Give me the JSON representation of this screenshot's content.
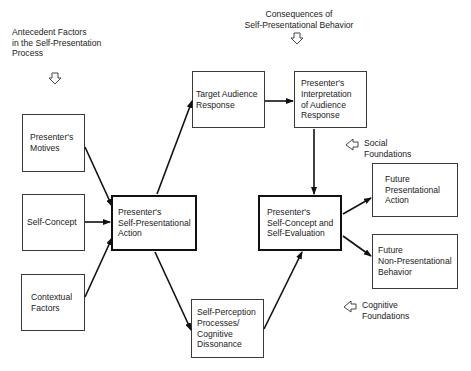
{
  "diagram": {
    "headers": {
      "antecedent": "Antecedent Factors\nin the Self-Presentation\nProcess",
      "consequences": "Consequences of\nSelf-Presentational Behavior"
    },
    "side_labels": {
      "social": "Social\nFoundations",
      "cognitive": "Cognitive\nFoundations"
    },
    "boxes": {
      "motives": "Presenter's\nMotives",
      "self_concept": "Self-Concept",
      "contextual": "Contextual\nFactors",
      "action": "Presenter's\nSelf-Presentational\nAction",
      "target_response": "Target Audience\nResponse",
      "interpretation": "Presenter's\nInterpretation\nof Audience\nResponse",
      "self_evaluation": "Presenter's\nSelf-Concept and\nSelf-Evaluation",
      "future_action": "Future\nPresentational\nAction",
      "future_behavior": "Future\nNon-Presentational\nBehavior",
      "self_perception": "Self-Perception\nProcesses/\nCognitive\nDissonance"
    },
    "edges": [
      {
        "from": "motives",
        "to": "action"
      },
      {
        "from": "self_concept",
        "to": "action"
      },
      {
        "from": "contextual",
        "to": "action"
      },
      {
        "from": "action",
        "to": "target_response"
      },
      {
        "from": "action",
        "to": "self_perception"
      },
      {
        "from": "target_response",
        "to": "interpretation"
      },
      {
        "from": "interpretation",
        "to": "self_evaluation"
      },
      {
        "from": "self_perception",
        "to": "self_evaluation"
      },
      {
        "from": "self_evaluation",
        "to": "future_action"
      },
      {
        "from": "self_evaluation",
        "to": "future_behavior"
      }
    ],
    "colors": {
      "line": "#111111",
      "box_border": "#3a3a3a",
      "background": "#ffffff"
    }
  }
}
